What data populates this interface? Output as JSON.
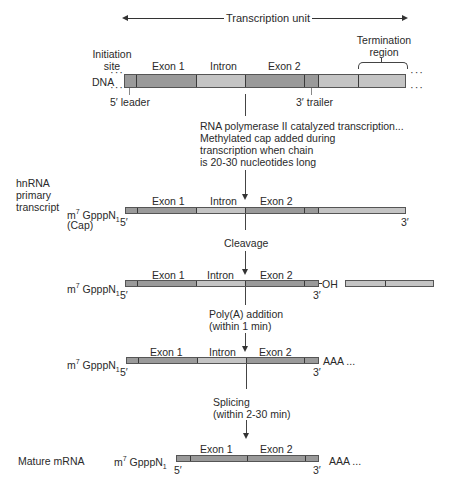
{
  "title": "Transcription unit",
  "dna": {
    "label": "DNA",
    "initiation_site": "Initiation site",
    "termination_region": "Termination region",
    "five_leader": "5′ leader",
    "three_trailer": "3′ trailer",
    "exon1": "Exon 1",
    "intron": "Intron",
    "exon2": "Exon 2"
  },
  "step1": {
    "lines": [
      "RNA polymerase II catalyzed transcription...",
      "Methylated cap added during",
      "transcription when chain",
      "is 20-30 nucleotides long"
    ]
  },
  "hnrna": {
    "side_label": [
      "hnRNA",
      "primary",
      "transcript"
    ],
    "cap_main": "m",
    "cap_sup": "7",
    "cap_rest": " GpppN",
    "cap_sub": "1",
    "cap_note": "(Cap)",
    "five": "5′",
    "three": "3′",
    "exon1": "Exon 1",
    "intron": "Intron",
    "exon2": "Exon 2"
  },
  "step2": {
    "label": "Cleavage"
  },
  "cleaved": {
    "exon1": "Exon 1",
    "intron": "Intron",
    "exon2": "Exon 2",
    "oh": "OH",
    "five": "5′",
    "three": "3′"
  },
  "step3": {
    "lines": [
      "Poly(A) addition",
      "(within 1 min)"
    ]
  },
  "polya": {
    "exon1": "Exon 1",
    "intron": "Intron",
    "exon2": "Exon 2",
    "tail": "AAA ...",
    "five": "5′",
    "three": "3′"
  },
  "step4": {
    "lines": [
      "Splicing",
      "(within 2-30 min)"
    ]
  },
  "mature": {
    "side_label": "Mature mRNA",
    "exon1": "Exon 1",
    "exon2": "Exon 2",
    "tail": "AAA ...",
    "five": "5′",
    "three": "3′"
  },
  "colors": {
    "exon": "#9a9a9a",
    "intron": "#c4c4c4",
    "outline": "#555555"
  }
}
